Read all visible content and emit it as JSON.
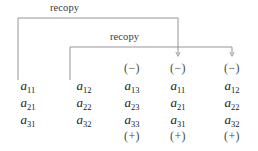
{
  "figure": {
    "line_color": "#8a8a8a",
    "text_color": "#1a1a1a",
    "sign_color": "#4a4a4a",
    "background": "#ffffff"
  },
  "annotations": [
    {
      "label": "recopy"
    },
    {
      "label": "recopy"
    }
  ],
  "columns": [
    {
      "name": "column-1",
      "top_sign": "",
      "entries": [
        "a",
        "a",
        "a"
      ],
      "subscripts": [
        "11",
        "21",
        "31"
      ],
      "bottom_sign": ""
    },
    {
      "name": "column-2",
      "top_sign": "",
      "entries": [
        "a",
        "a",
        "a"
      ],
      "subscripts": [
        "12",
        "22",
        "32"
      ],
      "bottom_sign": ""
    },
    {
      "name": "column-3",
      "top_sign": "(−)",
      "entries": [
        "a",
        "a",
        "a"
      ],
      "subscripts": [
        "13",
        "23",
        "33"
      ],
      "bottom_sign": "(+)"
    },
    {
      "name": "column-4",
      "top_sign": "(−)",
      "entries": [
        "a",
        "a",
        "a"
      ],
      "subscripts": [
        "11",
        "21",
        "31"
      ],
      "bottom_sign": "(+)"
    },
    {
      "name": "column-5",
      "top_sign": "(−)",
      "entries": [
        "a",
        "a",
        "a"
      ],
      "subscripts": [
        "12",
        "22",
        "32"
      ],
      "bottom_sign": "(+)"
    }
  ]
}
